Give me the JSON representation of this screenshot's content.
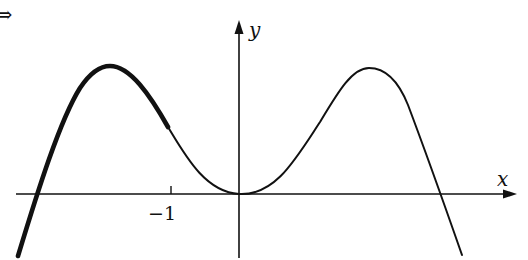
{
  "figure": {
    "marker_glyph": "⇒",
    "axes": {
      "x_label": "x",
      "y_label": "y",
      "tick_labels": [
        {
          "value": -1,
          "text": "−1"
        }
      ],
      "color": "#111111"
    },
    "curve": {
      "description": "Even-looking quartic-style curve: local minimum at origin, two local maxima, crossing x-axis on both sides",
      "features": {
        "local_min": [
          0,
          0
        ],
        "left_max_x_approx": -1.9,
        "right_max_x_approx": 1.9,
        "left_root_x_approx": -3.0,
        "right_root_x_approx": 3.0
      },
      "highlighted_segment": "Thicker stroke from the lower-left end up through the left maximum to about x = -1",
      "color": "#111111"
    }
  }
}
